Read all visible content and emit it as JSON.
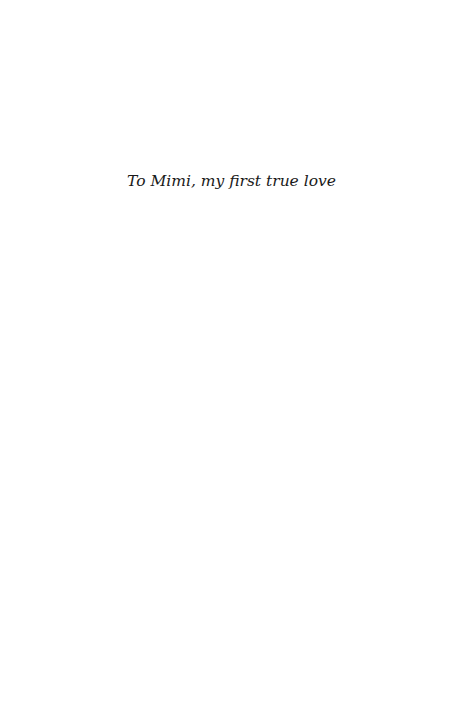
{
  "page": {
    "type": "dedication",
    "background_color": "#ffffff",
    "text_color": "#1a1a1a"
  },
  "dedication": {
    "text": "To Mimi, my first true love"
  }
}
